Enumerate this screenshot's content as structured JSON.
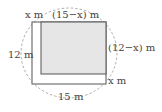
{
  "diagram": {
    "outer_rect": {
      "width_label": "15 m",
      "height_label": "12 m"
    },
    "inner_rect": {
      "width_label": "(15−x) m",
      "height_label": "(12−x) m",
      "fill": "#e6e6e6"
    },
    "strip_labels": {
      "top_left": "x m",
      "bottom_right": "x m"
    },
    "boundary": "dashed ellipse",
    "colors": {
      "line": "#555555",
      "dashed": "#999999",
      "shade": "#e6e6e6"
    }
  }
}
